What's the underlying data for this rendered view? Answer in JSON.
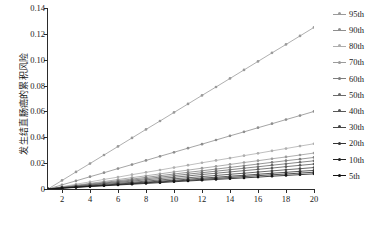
{
  "chart_data": {
    "type": "line",
    "title": "",
    "subtitle": "",
    "xlabel": "",
    "ylabel": "发生结直肠癌的累积风险",
    "xlim": [
      1,
      20
    ],
    "ylim": [
      0,
      0.14
    ],
    "xticks": [
      2,
      4,
      6,
      8,
      10,
      12,
      14,
      16,
      18,
      20
    ],
    "yticks": [
      0,
      0.02,
      0.04,
      0.06,
      0.08,
      0.1,
      0.12,
      0.14
    ],
    "ytick_labels": [
      "0",
      "0.02",
      "0.04",
      "0.06",
      "0.08",
      "0.10",
      "0.12",
      "0.14"
    ],
    "xtick_labels": [
      "2",
      "4",
      "6",
      "8",
      "10",
      "12",
      "14",
      "16",
      "18",
      "20"
    ],
    "grid": false,
    "legend_position": "right",
    "marker": "circle",
    "x": [
      1,
      2,
      3,
      4,
      5,
      6,
      7,
      8,
      9,
      10,
      11,
      12,
      13,
      14,
      15,
      16,
      17,
      18,
      19,
      20
    ],
    "series": [
      {
        "name": "95th",
        "color": "#9a9a9a",
        "values": [
          0.0,
          0.0066,
          0.0132,
          0.0197,
          0.0263,
          0.0329,
          0.0395,
          0.0461,
          0.0526,
          0.0592,
          0.0658,
          0.0724,
          0.0789,
          0.0855,
          0.0921,
          0.0987,
          0.1053,
          0.1118,
          0.1184,
          0.125
        ]
      },
      {
        "name": "90th",
        "color": "#8e8e8e",
        "values": [
          0.0,
          0.0032,
          0.0063,
          0.0095,
          0.0126,
          0.0158,
          0.0189,
          0.0221,
          0.0253,
          0.0284,
          0.0316,
          0.0347,
          0.0379,
          0.0411,
          0.0442,
          0.0474,
          0.0505,
          0.0537,
          0.0568,
          0.06
        ]
      },
      {
        "name": "80th",
        "color": "#aeaeae",
        "values": [
          0.0,
          0.0018,
          0.0037,
          0.0055,
          0.0074,
          0.0092,
          0.0111,
          0.0129,
          0.0147,
          0.0166,
          0.0184,
          0.0203,
          0.0221,
          0.0239,
          0.0258,
          0.0276,
          0.0295,
          0.0313,
          0.0332,
          0.035
        ]
      },
      {
        "name": "70th",
        "color": "#9b9b9b",
        "values": [
          0.0,
          0.0015,
          0.0029,
          0.0044,
          0.0058,
          0.0073,
          0.0088,
          0.0102,
          0.0117,
          0.0132,
          0.0146,
          0.0161,
          0.0175,
          0.019,
          0.0205,
          0.0219,
          0.0234,
          0.0248,
          0.0263,
          0.0278
        ]
      },
      {
        "name": "60th",
        "color": "#7d7d7d",
        "values": [
          0.0,
          0.0013,
          0.0026,
          0.0039,
          0.0051,
          0.0064,
          0.0077,
          0.009,
          0.0103,
          0.0116,
          0.0129,
          0.0141,
          0.0154,
          0.0167,
          0.018,
          0.0193,
          0.0206,
          0.0219,
          0.0231,
          0.0244
        ]
      },
      {
        "name": "50th",
        "color": "#6a6a6a",
        "values": [
          0.0,
          0.0011,
          0.0023,
          0.0034,
          0.0046,
          0.0057,
          0.0069,
          0.008,
          0.0092,
          0.0103,
          0.0115,
          0.0126,
          0.0138,
          0.0149,
          0.0161,
          0.0172,
          0.0184,
          0.0195,
          0.0207,
          0.0218
        ]
      },
      {
        "name": "40th",
        "color": "#585858",
        "values": [
          0.0,
          0.001,
          0.002,
          0.003,
          0.0041,
          0.0051,
          0.0061,
          0.0071,
          0.0081,
          0.0091,
          0.0101,
          0.0112,
          0.0122,
          0.0132,
          0.0142,
          0.0152,
          0.0162,
          0.0173,
          0.0183,
          0.0193
        ]
      },
      {
        "name": "30th",
        "color": "#454545",
        "values": [
          0.0,
          0.0009,
          0.0017,
          0.0026,
          0.0035,
          0.0044,
          0.0052,
          0.0061,
          0.007,
          0.0079,
          0.0087,
          0.0096,
          0.0105,
          0.0114,
          0.0122,
          0.0131,
          0.014,
          0.0149,
          0.0157,
          0.0166
        ]
      },
      {
        "name": "20th",
        "color": "#343434",
        "values": [
          0.0,
          0.0008,
          0.0015,
          0.0023,
          0.003,
          0.0038,
          0.0046,
          0.0053,
          0.0061,
          0.0068,
          0.0076,
          0.0084,
          0.0091,
          0.0099,
          0.0106,
          0.0114,
          0.0122,
          0.0129,
          0.0137,
          0.0144
        ]
      },
      {
        "name": "10th",
        "color": "#242424",
        "values": [
          0.0,
          0.0007,
          0.0014,
          0.0021,
          0.0027,
          0.0034,
          0.0041,
          0.0048,
          0.0055,
          0.0062,
          0.0068,
          0.0075,
          0.0082,
          0.0089,
          0.0096,
          0.0103,
          0.011,
          0.0116,
          0.0123,
          0.013
        ]
      },
      {
        "name": "5th",
        "color": "#141414",
        "values": [
          0.0,
          0.0006,
          0.0012,
          0.0019,
          0.0025,
          0.0031,
          0.0037,
          0.0043,
          0.0049,
          0.0056,
          0.0062,
          0.0068,
          0.0074,
          0.008,
          0.0086,
          0.0092,
          0.0099,
          0.0105,
          0.0111,
          0.0117
        ]
      }
    ]
  },
  "legend": {
    "entries": [
      {
        "label": "95th"
      },
      {
        "label": "90th"
      },
      {
        "label": "80th"
      },
      {
        "label": "70th"
      },
      {
        "label": "60th"
      },
      {
        "label": "50th"
      },
      {
        "label": "40th"
      },
      {
        "label": "30th"
      },
      {
        "label": "20th"
      },
      {
        "label": "10th"
      },
      {
        "label": "5th"
      }
    ]
  },
  "colors": {
    "axis": "#2b2b2b",
    "text": "#1a1a1a",
    "background": "#ffffff"
  }
}
